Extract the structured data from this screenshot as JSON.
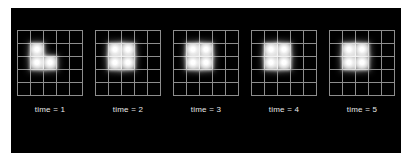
{
  "figure": {
    "background_color": "#ffffff",
    "canvas_color": "#000000",
    "grid_line_color": "#8d8d8d",
    "cell_color": "#ffffff",
    "label_color": "#e8e8e8"
  },
  "chart_data": {
    "type": "heatmap",
    "title": "",
    "subtitle": "",
    "xlabel": "",
    "ylabel": "",
    "grid": true,
    "legend_position": "none",
    "grid_rows": 5,
    "grid_cols": 5,
    "cell_states": {
      "alive": 1,
      "dead": 0
    },
    "panels": [
      {
        "label": "time = 1",
        "time": 1,
        "live_cell_count": 3,
        "live_cells": [
          [
            1,
            1
          ],
          [
            2,
            1
          ],
          [
            2,
            2
          ]
        ],
        "matrix": [
          [
            0,
            0,
            0,
            0,
            0
          ],
          [
            0,
            1,
            0,
            0,
            0
          ],
          [
            0,
            1,
            1,
            0,
            0
          ],
          [
            0,
            0,
            0,
            0,
            0
          ],
          [
            0,
            0,
            0,
            0,
            0
          ]
        ]
      },
      {
        "label": "time = 2",
        "time": 2,
        "live_cell_count": 4,
        "live_cells": [
          [
            1,
            1
          ],
          [
            1,
            2
          ],
          [
            2,
            1
          ],
          [
            2,
            2
          ]
        ],
        "matrix": [
          [
            0,
            0,
            0,
            0,
            0
          ],
          [
            0,
            1,
            1,
            0,
            0
          ],
          [
            0,
            1,
            1,
            0,
            0
          ],
          [
            0,
            0,
            0,
            0,
            0
          ],
          [
            0,
            0,
            0,
            0,
            0
          ]
        ]
      },
      {
        "label": "time = 3",
        "time": 3,
        "live_cell_count": 4,
        "live_cells": [
          [
            1,
            1
          ],
          [
            1,
            2
          ],
          [
            2,
            1
          ],
          [
            2,
            2
          ]
        ],
        "matrix": [
          [
            0,
            0,
            0,
            0,
            0
          ],
          [
            0,
            1,
            1,
            0,
            0
          ],
          [
            0,
            1,
            1,
            0,
            0
          ],
          [
            0,
            0,
            0,
            0,
            0
          ],
          [
            0,
            0,
            0,
            0,
            0
          ]
        ]
      },
      {
        "label": "time = 4",
        "time": 4,
        "live_cell_count": 4,
        "live_cells": [
          [
            1,
            1
          ],
          [
            1,
            2
          ],
          [
            2,
            1
          ],
          [
            2,
            2
          ]
        ],
        "matrix": [
          [
            0,
            0,
            0,
            0,
            0
          ],
          [
            0,
            1,
            1,
            0,
            0
          ],
          [
            0,
            1,
            1,
            0,
            0
          ],
          [
            0,
            0,
            0,
            0,
            0
          ],
          [
            0,
            0,
            0,
            0,
            0
          ]
        ]
      },
      {
        "label": "time = 5",
        "time": 5,
        "live_cell_count": 4,
        "live_cells": [
          [
            1,
            1
          ],
          [
            1,
            2
          ],
          [
            2,
            1
          ],
          [
            2,
            2
          ]
        ],
        "matrix": [
          [
            0,
            0,
            0,
            0,
            0
          ],
          [
            0,
            1,
            1,
            0,
            0
          ],
          [
            0,
            1,
            1,
            0,
            0
          ],
          [
            0,
            0,
            0,
            0,
            0
          ],
          [
            0,
            0,
            0,
            0,
            0
          ]
        ]
      }
    ]
  }
}
